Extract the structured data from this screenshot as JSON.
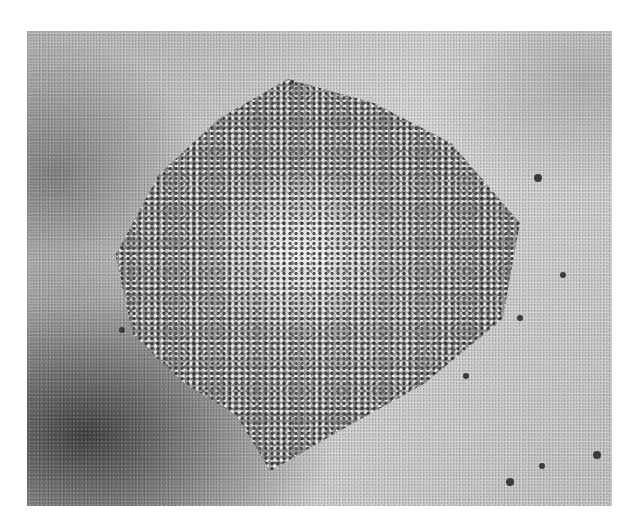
{
  "image": {
    "description": "Grayscale photograph of a roughly diamond-shaped pile of mixed gravel/sand grains on a concrete or sandy surface",
    "frame": {
      "left": 27,
      "top": 31,
      "width": 585,
      "height": 475
    },
    "colors": {
      "page_background": "#ffffff",
      "surface_light": "#d8d8d8",
      "surface_dark": "#3c3c3c",
      "pile_mid": "#8a8a8a",
      "pile_center_light": "#f0f0f0"
    },
    "stray_grains": [
      {
        "x": 538,
        "y": 178,
        "r": 4
      },
      {
        "x": 563,
        "y": 275,
        "r": 3
      },
      {
        "x": 520,
        "y": 318,
        "r": 3
      },
      {
        "x": 466,
        "y": 376,
        "r": 3
      },
      {
        "x": 510,
        "y": 482,
        "r": 4
      },
      {
        "x": 542,
        "y": 466,
        "r": 3
      },
      {
        "x": 597,
        "y": 455,
        "r": 4
      },
      {
        "x": 122,
        "y": 330,
        "r": 3
      },
      {
        "x": 292,
        "y": 82,
        "r": 2
      }
    ]
  }
}
